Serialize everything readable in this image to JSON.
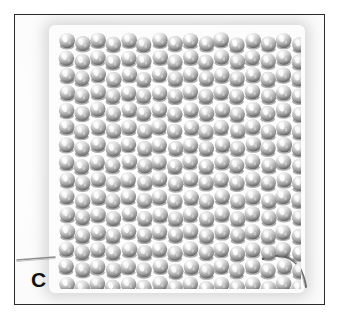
{
  "figure": {
    "panel_label": "C",
    "caption_text": "",
    "domain": "scientific-micrograph-panel",
    "background_color": "#ffffff",
    "frame_color": "#2b2b2b",
    "frame_rect": {
      "x": 14,
      "y": 14,
      "width": 311,
      "height": 291
    }
  },
  "specimen": {
    "name": "bead-woven-fabric",
    "description": "Square woven textile of metallic spherical beads",
    "bead_colors": {
      "body": "#b4b4b4",
      "highlight": "#f4f4f4",
      "midtone": "#9a9a9a",
      "shadow": "#5c5c5c",
      "gap": "#6e6e6e"
    },
    "grid": {
      "columns": 16,
      "rows": 15,
      "bead_diameter_px": 15.6,
      "column_pitch_px": 15.5,
      "row_pitch_px": 17.4,
      "stagger": "alternating-column-offset"
    },
    "threads": [
      {
        "name": "left-warp-thread",
        "color": "#8a8a8a",
        "path": "M 0,245 L 40,243"
      },
      {
        "name": "right-warp-thread",
        "color": "#6f6f6f",
        "path": "M 252,246 C 272,240 288,246 292,268"
      }
    ]
  }
}
